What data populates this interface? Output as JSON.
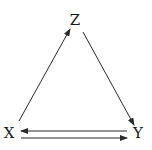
{
  "diagram": {
    "nodes": [
      {
        "id": "Z",
        "label": "Z",
        "x": 75,
        "y": 20
      },
      {
        "id": "X",
        "label": "X",
        "x": 9,
        "y": 133
      },
      {
        "id": "Y",
        "label": "Y",
        "x": 138,
        "y": 133
      }
    ],
    "edges": [
      {
        "from": "X",
        "to": "Z",
        "x1": 19,
        "y1": 121,
        "x2": 70,
        "y2": 29
      },
      {
        "from": "Z",
        "to": "Y",
        "x1": 83,
        "y1": 32,
        "x2": 134,
        "y2": 125
      },
      {
        "from": "Y",
        "to": "X",
        "x1": 127,
        "y1": 131,
        "x2": 21,
        "y2": 131
      },
      {
        "from": "X",
        "to": "Y",
        "x1": 21,
        "y1": 138,
        "x2": 127,
        "y2": 138
      }
    ],
    "colors": {
      "stroke": "#2a2a2a",
      "text": "#1a1a1a",
      "background": "#ffffff"
    }
  }
}
